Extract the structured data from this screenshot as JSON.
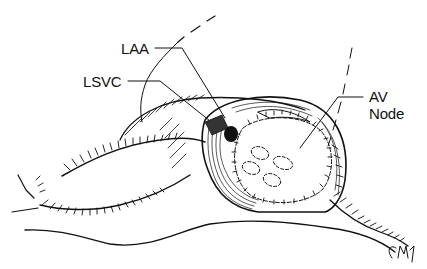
{
  "figure": {
    "type": "surgical line illustration",
    "labels": [
      {
        "id": "laa",
        "text": "LAA"
      },
      {
        "id": "lsvc",
        "text": "LSVC"
      },
      {
        "id": "av",
        "text": "AV"
      },
      {
        "id": "node",
        "text": "Node"
      }
    ],
    "annotations": {
      "laa": "LAA",
      "lsvc": "LSVC",
      "av_node_line1": "AV",
      "av_node_line2": "Node"
    },
    "signature": "CMM",
    "colors": {
      "ink": "#111111",
      "background": "#ffffff"
    }
  }
}
